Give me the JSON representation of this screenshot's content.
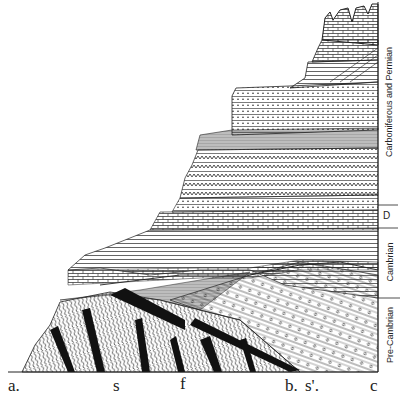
{
  "figure": {
    "type": "geological cross-section",
    "colors": {
      "ink": "#1a1a1a",
      "paper": "#ffffff"
    }
  },
  "periods": [
    {
      "label": "Carboniferous and Permian",
      "top": 0,
      "bottom": 205
    },
    {
      "label": "D",
      "top": 205,
      "bottom": 228
    },
    {
      "label": "Cambrian",
      "top": 228,
      "bottom": 298
    },
    {
      "label": "Pre-Cambrian",
      "top": 298,
      "bottom": 372
    }
  ],
  "locations": [
    {
      "label": "a.",
      "x": 8
    },
    {
      "label": "s",
      "x": 113
    },
    {
      "label": "f",
      "x": 180
    },
    {
      "label": "b.",
      "x": 285
    },
    {
      "label": "s'.",
      "x": 305
    },
    {
      "label": "c",
      "x": 370
    }
  ]
}
